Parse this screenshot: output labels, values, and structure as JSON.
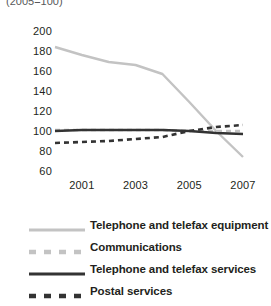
{
  "subtitle": "(2005=100)",
  "colors": {
    "light": "#c3c3c3",
    "dark": "#333333",
    "text": "#231f20",
    "subtitle": "#58595b",
    "background": "#ffffff"
  },
  "legend": [
    {
      "label": "Telephone and telefax equipment",
      "style": "solid",
      "color": "#c3c3c3",
      "swatch": "light-solid-swatch"
    },
    {
      "label": "Communications",
      "style": "dashed",
      "color": "#c3c3c3",
      "swatch": "light-dashed-swatch"
    },
    {
      "label": "Telephone and telefax services",
      "style": "solid",
      "color": "#333333",
      "swatch": "dark-solid-swatch"
    },
    {
      "label": "Postal services",
      "style": "dashed",
      "color": "#333333",
      "swatch": "dark-dashed-swatch"
    }
  ],
  "chart_data": {
    "type": "line",
    "title": "",
    "subtitle": "(2005=100)",
    "xlabel": "",
    "ylabel": "",
    "xlim": [
      2000,
      2007
    ],
    "ylim": [
      60,
      200
    ],
    "yticks": [
      60,
      80,
      100,
      120,
      140,
      160,
      180,
      200
    ],
    "xticks": [
      2001,
      2003,
      2005,
      2007
    ],
    "grid": false,
    "legend_position": "bottom",
    "x": [
      2000,
      2001,
      2002,
      2003,
      2004,
      2005,
      2006,
      2007
    ],
    "series": [
      {
        "name": "Telephone and telefax equipment",
        "style": "solid",
        "color": "#c3c3c3",
        "values": [
          184,
          176,
          169,
          166,
          157,
          129,
          100,
          74
        ]
      },
      {
        "name": "Communications",
        "style": "dashed",
        "color": "#c3c3c3",
        "values": [
          101,
          101,
          101,
          101,
          101,
          100,
          100,
          100
        ]
      },
      {
        "name": "Telephone and telefax services",
        "style": "solid",
        "color": "#333333",
        "values": [
          100,
          101,
          101,
          101,
          101,
          100,
          98,
          97
        ]
      },
      {
        "name": "Postal services",
        "style": "dashed",
        "color": "#333333",
        "values": [
          88,
          89,
          90,
          92,
          94,
          100,
          104,
          106
        ]
      }
    ]
  }
}
